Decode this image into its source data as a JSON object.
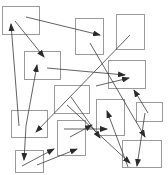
{
  "diagram": {
    "width": 168,
    "height": 175,
    "colors": {
      "box_stroke": "#9a9a9a",
      "arrow_stroke": "#3a3a3a",
      "background": "#ffffff"
    },
    "boxes": [
      {
        "id": "b1",
        "x": 2,
        "y": 6,
        "w": 37,
        "h": 28
      },
      {
        "id": "b2",
        "x": 75,
        "y": 18,
        "w": 28,
        "h": 36
      },
      {
        "id": "b3",
        "x": 116,
        "y": 14,
        "w": 28,
        "h": 35
      },
      {
        "id": "b4",
        "x": 24,
        "y": 51,
        "w": 36,
        "h": 28
      },
      {
        "id": "b5",
        "x": 108,
        "y": 60,
        "w": 37,
        "h": 28
      },
      {
        "id": "b6",
        "x": 11,
        "y": 110,
        "w": 36,
        "h": 27
      },
      {
        "id": "b7",
        "x": 54,
        "y": 85,
        "w": 35,
        "h": 28
      },
      {
        "id": "b8",
        "x": 96,
        "y": 99,
        "w": 28,
        "h": 36
      },
      {
        "id": "b9",
        "x": 136,
        "y": 102,
        "w": 26,
        "h": 19
      },
      {
        "id": "b10",
        "x": 122,
        "y": 140,
        "w": 39,
        "h": 27
      },
      {
        "id": "b11",
        "x": 15,
        "y": 150,
        "w": 28,
        "h": 22
      },
      {
        "id": "b12",
        "x": 57,
        "y": 120,
        "w": 28,
        "h": 35
      }
    ],
    "arrows": [
      {
        "from": [
          26,
          17
        ],
        "to": [
          100,
          35
        ]
      },
      {
        "from": [
          15,
          21
        ],
        "to": [
          44,
          57
        ]
      },
      {
        "from": [
          19,
          126
        ],
        "to": [
          11,
          24
        ]
      },
      {
        "from": [
          26,
          126
        ],
        "to": [
          37,
          65
        ]
      },
      {
        "from": [
          26,
          126
        ],
        "to": [
          24,
          160
        ]
      },
      {
        "from": [
          130,
          35
        ],
        "to": [
          36,
          132
        ]
      },
      {
        "from": [
          47,
          68
        ],
        "to": [
          125,
          75
        ]
      },
      {
        "from": [
          90,
          43
        ],
        "to": [
          145,
          137
        ]
      },
      {
        "from": [
          96,
          86
        ],
        "to": [
          129,
          78
        ]
      },
      {
        "from": [
          148,
          113
        ],
        "to": [
          134,
          90
        ]
      },
      {
        "from": [
          67,
          105
        ],
        "to": [
          130,
          163
        ]
      },
      {
        "from": [
          145,
          113
        ],
        "to": [
          137,
          166
        ]
      },
      {
        "from": [
          70,
          137
        ],
        "to": [
          92,
          125
        ]
      },
      {
        "from": [
          64,
          129
        ],
        "to": [
          107,
          129
        ]
      },
      {
        "from": [
          128,
          167
        ],
        "to": [
          107,
          111
        ]
      },
      {
        "from": [
          22,
          166
        ],
        "to": [
          54,
          149
        ]
      },
      {
        "from": [
          71,
          97
        ],
        "to": [
          100,
          138
        ]
      },
      {
        "from": [
          37,
          165
        ],
        "to": [
          77,
          149
        ]
      }
    ]
  }
}
